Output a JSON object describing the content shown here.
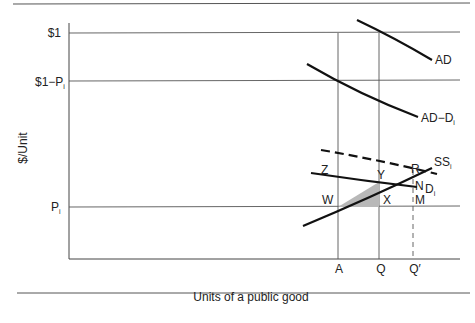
{
  "diagram": {
    "y_axis_label": "$/Unit",
    "x_axis_label": "Units of a public good",
    "y_ticks": [
      {
        "label": "$1",
        "sub": ""
      },
      {
        "label": "$1−P",
        "sub": "i"
      },
      {
        "label": "P",
        "sub": "i"
      }
    ],
    "x_ticks": [
      "A",
      "Q",
      "Q′"
    ],
    "curves": [
      {
        "name": "AD",
        "label": "AD",
        "sub": ""
      },
      {
        "name": "AD-Di",
        "label": "AD−D",
        "sub": "i"
      },
      {
        "name": "SSi",
        "label": "SS",
        "sub": "i"
      },
      {
        "name": "Di",
        "label": "D",
        "sub": "i"
      },
      {
        "name": "dashed-demand",
        "label": "",
        "sub": ""
      }
    ],
    "points": [
      "Z",
      "Y",
      "W",
      "X",
      "R",
      "N",
      "M"
    ],
    "shaded_region": "triangle WYX"
  }
}
